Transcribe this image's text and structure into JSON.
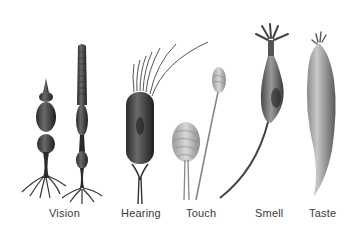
{
  "figure": {
    "cells": [
      {
        "id": "vision",
        "label": "Vision",
        "label_x": 49
      },
      {
        "id": "hearing",
        "label": "Hearing",
        "label_x": 121
      },
      {
        "id": "touch",
        "label": "Touch",
        "label_x": 186
      },
      {
        "id": "smell",
        "label": "Smell",
        "label_x": 255
      },
      {
        "id": "taste",
        "label": "Taste",
        "label_x": 309
      }
    ]
  }
}
